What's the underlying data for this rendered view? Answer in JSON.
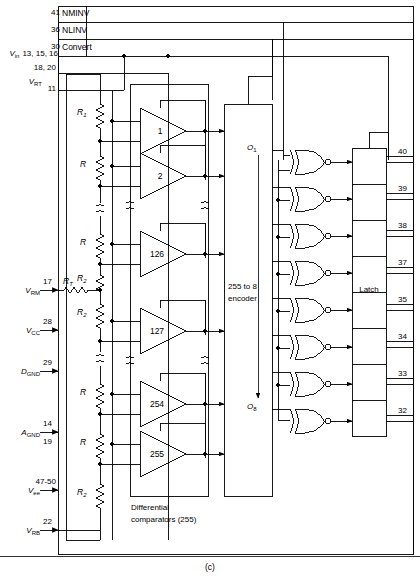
{
  "figure": {
    "caption": "(c)",
    "type": "flash-adc-block-diagram"
  },
  "top_signals": [
    {
      "pin": "41",
      "name": "NMINV"
    },
    {
      "pin": "36",
      "name": "NLINV"
    },
    {
      "pin": "30",
      "name": "Convert"
    }
  ],
  "left_signals": [
    {
      "label": "V",
      "sub": "in",
      "pins": "13, 15, 16",
      "pins2": "18, 20"
    },
    {
      "label": "V",
      "sub": "RT",
      "pins": "11"
    },
    {
      "label": "V",
      "sub": "RM",
      "pins": "17"
    },
    {
      "label": "V",
      "sub": "CC",
      "pins": "28"
    },
    {
      "label": "D",
      "sub": "GND",
      "pins": "29"
    },
    {
      "label": "A",
      "sub": "GND",
      "pins": "14",
      "pins2": "19"
    },
    {
      "label": "V",
      "sub": "ee",
      "pins": "47-50"
    },
    {
      "label": "V",
      "sub": "RB",
      "pins": "22"
    }
  ],
  "ladder": {
    "top_resistors": [
      "R1",
      "R",
      "R",
      "R2"
    ],
    "series_resistor": "RT",
    "bottom_resistors": [
      "R2",
      "R",
      "R",
      "R2"
    ],
    "labels": {
      "r1": "R",
      "r1_sub": "1",
      "r": "R",
      "r2": "R",
      "r2_sub": "2",
      "rt": "R",
      "rt_sub": "T",
      "approx": "≈"
    }
  },
  "comparators": {
    "numbers": [
      "1",
      "2",
      "126",
      "127",
      "254",
      "255"
    ],
    "caption_line1": "Differential",
    "caption_line2": "comparators (255)"
  },
  "encoder": {
    "line1": "255 to 8",
    "line2": "encoder",
    "out_first": "O",
    "out_first_sub": "1",
    "out_last": "O",
    "out_last_sub": "8"
  },
  "latch": {
    "label": "Latch",
    "cells": 8
  },
  "output_pins": [
    "40",
    "39",
    "38",
    "37",
    "35",
    "34",
    "33",
    "32"
  ],
  "colors": {
    "line": "#000000",
    "background": "#ffffff",
    "text": "#000000"
  }
}
